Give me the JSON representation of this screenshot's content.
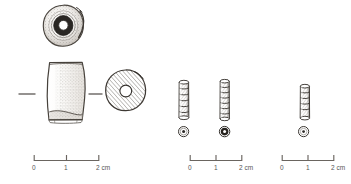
{
  "plate": {
    "title": "Archaeological bead illustration plate",
    "background_color": "#ffffff",
    "ink_color": "#3a3a3a",
    "label_color": "#555555"
  },
  "objects": [
    {
      "id": "large-bead-end-view",
      "name": "large-bead-end-view",
      "description": "End-on view of large barrel bead showing central perforation",
      "shape": "annular-disc",
      "x": 62,
      "y": 29,
      "radius": 24
    },
    {
      "id": "large-bead-profile",
      "name": "large-bead-profile",
      "description": "Side profile of large barrel-shaped bead with stippled shading",
      "shape": "barrel-profile",
      "x": 65,
      "y": 95,
      "width": 46,
      "height": 68
    },
    {
      "id": "large-bead-section",
      "name": "large-bead-section",
      "description": "Hatched cross-section of large bead with central bore",
      "shape": "hatched-disc",
      "x": 125,
      "y": 91,
      "radius": 21
    },
    {
      "id": "segmented-bead-1",
      "name": "segmented-bead-1",
      "description": "Small segmented ribbed bead, profile view",
      "shape": "ribbed-cylinder",
      "x": 183,
      "y": 101,
      "width": 14,
      "height": 40,
      "segments": 6
    },
    {
      "id": "segmented-bead-1-section",
      "name": "segmented-bead-1-section",
      "description": "Cross-section of segmented bead 1",
      "shape": "ring-with-dot",
      "x": 183,
      "y": 131,
      "radius": 5
    },
    {
      "id": "segmented-bead-2",
      "name": "segmented-bead-2",
      "description": "Small segmented ribbed bead, profile view",
      "shape": "ribbed-cylinder",
      "x": 224,
      "y": 101,
      "width": 13,
      "height": 42,
      "segments": 7
    },
    {
      "id": "segmented-bead-2-section",
      "name": "segmented-bead-2-section",
      "description": "Dark cross-section of segmented bead 2",
      "shape": "ring-with-dot-dark",
      "x": 224,
      "y": 131,
      "radius": 5
    },
    {
      "id": "segmented-bead-3",
      "name": "segmented-bead-3",
      "description": "Small segmented ribbed bead, profile view",
      "shape": "ribbed-cylinder",
      "x": 303,
      "y": 103,
      "width": 13,
      "height": 36,
      "segments": 5
    },
    {
      "id": "segmented-bead-3-section",
      "name": "segmented-bead-3-section",
      "description": "Cross-section of segmented bead 3",
      "shape": "ring-with-dot",
      "x": 303,
      "y": 131,
      "radius": 5
    }
  ],
  "scale_bars": [
    {
      "id": "scale-bar-left",
      "name": "scale-bar-left",
      "x": 33,
      "y": 160,
      "length": 65,
      "ticks": [
        "0",
        "1",
        "2"
      ],
      "unit": "cm",
      "unit_label": "2 cm"
    },
    {
      "id": "scale-bar-middle",
      "name": "scale-bar-middle",
      "x": 189,
      "y": 160,
      "length": 52,
      "ticks": [
        "0",
        "1",
        "2"
      ],
      "unit": "cm",
      "unit_label": "2 cm"
    },
    {
      "id": "scale-bar-right",
      "name": "scale-bar-right",
      "x": 281,
      "y": 160,
      "length": 52,
      "ticks": [
        "0",
        "1",
        "2"
      ],
      "unit": "cm",
      "unit_label": "2 cm"
    }
  ]
}
